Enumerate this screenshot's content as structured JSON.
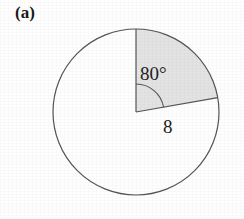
{
  "figure": {
    "part_label": "(a)",
    "type": "circle-sector-diagram",
    "angle_label": "80°",
    "radius_label": "8",
    "colors": {
      "background": "#fefefe",
      "stroke": "#555555",
      "sector_fill": "#e3e3e3",
      "text": "#1d1d1d"
    },
    "geometry": {
      "center_x": 136,
      "center_y": 112,
      "radius_px": 83,
      "sector_start_deg": 0,
      "sector_sweep_deg": 80,
      "angle_arc_marker_radius_px": 28
    }
  }
}
